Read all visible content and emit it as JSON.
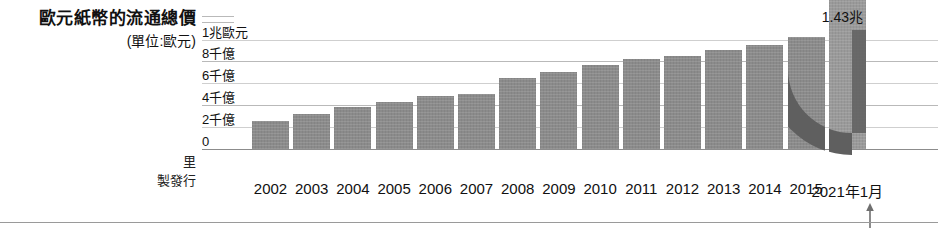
{
  "title": {
    "main": "歐元紙幣的流通總價",
    "sub": "(單位:歐元)"
  },
  "credits": {
    "lines": [
      "里",
      "製發行"
    ]
  },
  "colors": {
    "bar": "#8b8b8b",
    "bar_last": "#9a9a9a",
    "arc": "#5f5f5f",
    "gridline": "#b9b9b9",
    "text": "#111111"
  },
  "axis": {
    "y_ticks": [
      "0",
      "2千億",
      "4千億",
      "6千億",
      "8千億",
      "1兆歐元"
    ],
    "arrow_label": "arrow-up"
  },
  "chart_data": {
    "type": "bar",
    "title": "歐元紙幣的流通總價",
    "subtitle": "(單位:歐元)",
    "xlabel": "",
    "ylabel": "歐元",
    "unit": "歐元",
    "grid": true,
    "legend": "none",
    "ylim": [
      0,
      1500
    ],
    "ytick_values": [
      0,
      200,
      400,
      600,
      800,
      1000
    ],
    "ytick_labels": [
      "0",
      "2千億",
      "4千億",
      "6千億",
      "8千億",
      "1兆歐元"
    ],
    "categories": [
      "2002",
      "2003",
      "2004",
      "2005",
      "2006",
      "2007",
      "2008",
      "2009",
      "2010",
      "2011",
      "2012",
      "2013",
      "2014",
      "2015",
      "2021年1月"
    ],
    "values": [
      260,
      320,
      380,
      430,
      480,
      500,
      650,
      700,
      770,
      820,
      850,
      900,
      950,
      1020,
      1430
    ],
    "data_labels": {
      "2021年1月": "1.43兆"
    },
    "annotations": [
      "1.43兆"
    ]
  }
}
